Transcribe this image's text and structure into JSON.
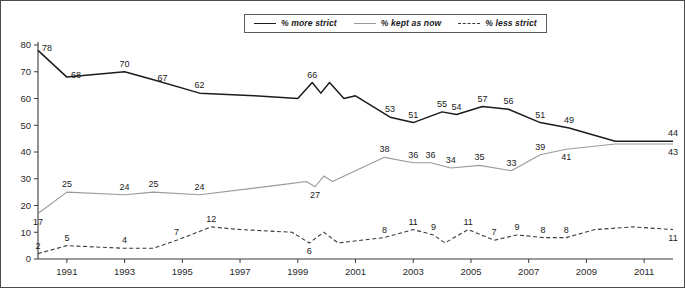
{
  "chart_data": {
    "type": "line",
    "title": "",
    "subtitle": "",
    "xlabel": "",
    "ylabel": "",
    "ylim": [
      0,
      80
    ],
    "xlim": [
      1990,
      2012
    ],
    "grid": false,
    "legend_position": "top-center",
    "y_ticks": [
      "0",
      "10",
      "20",
      "30",
      "40",
      "50",
      "60",
      "70",
      "80"
    ],
    "x_ticks": [
      "1991",
      "1993",
      "1995",
      "1997",
      "1999",
      "2001",
      "2003",
      "2005",
      "2007",
      "2009",
      "2011"
    ],
    "series": [
      {
        "name": "% more strict",
        "color": "#1c1c1c",
        "style": "solid",
        "points": [
          {
            "x": 1990.0,
            "y": 78,
            "label": "78",
            "label_pos": "right"
          },
          {
            "x": 1991.0,
            "y": 68,
            "label": "68",
            "label_pos": "right"
          },
          {
            "x": 1993.0,
            "y": 70,
            "label": "70",
            "label_pos": "above"
          },
          {
            "x": 1994.0,
            "y": 67,
            "label": "67",
            "label_pos": "right"
          },
          {
            "x": 1995.6,
            "y": 62,
            "label": "62",
            "label_pos": "above"
          },
          {
            "x": 1997.5,
            "y": 61,
            "label": "",
            "label_pos": "above"
          },
          {
            "x": 1999.0,
            "y": 60,
            "label": "",
            "label_pos": "above"
          },
          {
            "x": 1999.5,
            "y": 66,
            "label": "66",
            "label_pos": "above"
          },
          {
            "x": 1999.8,
            "y": 62,
            "label": "",
            "label_pos": "above"
          },
          {
            "x": 2000.1,
            "y": 66,
            "label": "",
            "label_pos": "above"
          },
          {
            "x": 2000.6,
            "y": 60,
            "label": "",
            "label_pos": "above"
          },
          {
            "x": 2001.0,
            "y": 61,
            "label": "",
            "label_pos": "above"
          },
          {
            "x": 2002.2,
            "y": 53,
            "label": "53",
            "label_pos": "above"
          },
          {
            "x": 2003.0,
            "y": 51,
            "label": "51",
            "label_pos": "above"
          },
          {
            "x": 2004.0,
            "y": 55,
            "label": "55",
            "label_pos": "above"
          },
          {
            "x": 2004.5,
            "y": 54,
            "label": "54",
            "label_pos": "above"
          },
          {
            "x": 2005.4,
            "y": 57,
            "label": "57",
            "label_pos": "above"
          },
          {
            "x": 2006.3,
            "y": 56,
            "label": "56",
            "label_pos": "above"
          },
          {
            "x": 2007.4,
            "y": 51,
            "label": "51",
            "label_pos": "above"
          },
          {
            "x": 2008.4,
            "y": 49,
            "label": "49",
            "label_pos": "above"
          },
          {
            "x": 2010.0,
            "y": 44,
            "label": "",
            "label_pos": "above"
          },
          {
            "x": 2012.0,
            "y": 44,
            "label": "44",
            "label_pos": "above"
          }
        ]
      },
      {
        "name": "% kept as now",
        "color": "#9a9a9a",
        "style": "solid",
        "points": [
          {
            "x": 1990.0,
            "y": 17,
            "label": "17",
            "label_pos": "below"
          },
          {
            "x": 1991.0,
            "y": 25,
            "label": "25",
            "label_pos": "above"
          },
          {
            "x": 1993.0,
            "y": 24,
            "label": "24",
            "label_pos": "above"
          },
          {
            "x": 1994.0,
            "y": 25,
            "label": "25",
            "label_pos": "above"
          },
          {
            "x": 1995.6,
            "y": 24,
            "label": "24",
            "label_pos": "above"
          },
          {
            "x": 1998.6,
            "y": 28,
            "label": "",
            "label_pos": "above"
          },
          {
            "x": 1999.3,
            "y": 29,
            "label": "",
            "label_pos": "above"
          },
          {
            "x": 1999.6,
            "y": 27,
            "label": "27",
            "label_pos": "below"
          },
          {
            "x": 1999.9,
            "y": 31,
            "label": "",
            "label_pos": "above"
          },
          {
            "x": 2000.2,
            "y": 29,
            "label": "",
            "label_pos": "above"
          },
          {
            "x": 2002.0,
            "y": 38,
            "label": "38",
            "label_pos": "above"
          },
          {
            "x": 2003.0,
            "y": 36,
            "label": "36",
            "label_pos": "above"
          },
          {
            "x": 2003.6,
            "y": 36,
            "label": "36",
            "label_pos": "above"
          },
          {
            "x": 2004.3,
            "y": 34,
            "label": "34",
            "label_pos": "above"
          },
          {
            "x": 2005.3,
            "y": 35,
            "label": "35",
            "label_pos": "above"
          },
          {
            "x": 2006.4,
            "y": 33,
            "label": "33",
            "label_pos": "above"
          },
          {
            "x": 2007.4,
            "y": 39,
            "label": "39",
            "label_pos": "above"
          },
          {
            "x": 2008.3,
            "y": 41,
            "label": "41",
            "label_pos": "below"
          },
          {
            "x": 2010.0,
            "y": 43,
            "label": "",
            "label_pos": "below"
          },
          {
            "x": 2012.0,
            "y": 43,
            "label": "43",
            "label_pos": "below"
          }
        ]
      },
      {
        "name": "% less strict",
        "color": "#3a3a3a",
        "style": "dashed",
        "points": [
          {
            "x": 1990.0,
            "y": 2,
            "label": "2",
            "label_pos": "above"
          },
          {
            "x": 1991.0,
            "y": 5,
            "label": "5",
            "label_pos": "above"
          },
          {
            "x": 1993.0,
            "y": 4,
            "label": "4",
            "label_pos": "above"
          },
          {
            "x": 1994.0,
            "y": 4,
            "label": "",
            "label_pos": "above"
          },
          {
            "x": 1994.8,
            "y": 7,
            "label": "7",
            "label_pos": "above"
          },
          {
            "x": 1996.0,
            "y": 12,
            "label": "12",
            "label_pos": "above"
          },
          {
            "x": 1997.0,
            "y": 11,
            "label": "",
            "label_pos": "above"
          },
          {
            "x": 1998.8,
            "y": 10,
            "label": "",
            "label_pos": "above"
          },
          {
            "x": 1999.4,
            "y": 6,
            "label": "6",
            "label_pos": "below"
          },
          {
            "x": 1999.9,
            "y": 10,
            "label": "",
            "label_pos": "above"
          },
          {
            "x": 2000.4,
            "y": 6,
            "label": "",
            "label_pos": "below"
          },
          {
            "x": 2002.0,
            "y": 8,
            "label": "8",
            "label_pos": "above"
          },
          {
            "x": 2003.0,
            "y": 11,
            "label": "11",
            "label_pos": "above"
          },
          {
            "x": 2003.7,
            "y": 9,
            "label": "9",
            "label_pos": "above"
          },
          {
            "x": 2004.1,
            "y": 6,
            "label": "",
            "label_pos": "below"
          },
          {
            "x": 2004.9,
            "y": 11,
            "label": "11",
            "label_pos": "above"
          },
          {
            "x": 2005.8,
            "y": 7,
            "label": "7",
            "label_pos": "above"
          },
          {
            "x": 2006.6,
            "y": 9,
            "label": "9",
            "label_pos": "above"
          },
          {
            "x": 2007.5,
            "y": 8,
            "label": "8",
            "label_pos": "above"
          },
          {
            "x": 2008.3,
            "y": 8,
            "label": "8",
            "label_pos": "above"
          },
          {
            "x": 2009.3,
            "y": 11,
            "label": "",
            "label_pos": "above"
          },
          {
            "x": 2010.6,
            "y": 12,
            "label": "",
            "label_pos": "above"
          },
          {
            "x": 2012.0,
            "y": 11,
            "label": "11",
            "label_pos": "below"
          }
        ]
      }
    ]
  },
  "legend": {
    "entries": [
      {
        "label": "% more strict",
        "swatch": "line-solid-dark-icon"
      },
      {
        "label": "% kept as now",
        "swatch": "line-solid-gray-icon"
      },
      {
        "label": "% less strict",
        "swatch": "line-dashed-icon"
      }
    ]
  }
}
